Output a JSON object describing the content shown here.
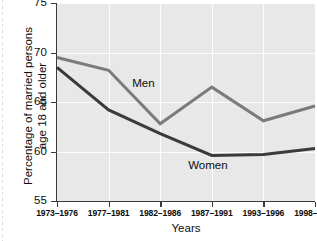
{
  "chart_data": {
    "type": "line",
    "title": "",
    "xlabel": "Years",
    "ylabel": "Percentage of married persons\nage 18 and older",
    "categories": [
      "1973–1976",
      "1977–1981",
      "1982–1986",
      "1987–1991",
      "1993–1996",
      "1998–2002"
    ],
    "ylim": [
      55,
      75
    ],
    "yticks": [
      55,
      60,
      65,
      70,
      75
    ],
    "ytick_labels": [
      "55",
      "60",
      "65",
      "70",
      "75"
    ],
    "grid": true,
    "legend_position": "inline-annotations",
    "series": [
      {
        "name": "Men",
        "color": "#7b7b7b",
        "values": [
          69.5,
          68.2,
          62.8,
          66.5,
          63.1,
          64.6
        ],
        "annotation": {
          "text": "Men",
          "x_frac": 0.335,
          "y_value": 66.9
        }
      },
      {
        "name": "Women",
        "color": "#3a3a3a",
        "values": [
          68.5,
          64.2,
          61.8,
          59.6,
          59.7,
          60.3
        ],
        "annotation": {
          "text": "Women",
          "x_frac": 0.585,
          "y_value": 58.6
        }
      }
    ]
  },
  "style": {
    "plot_background": "#e8e8e8",
    "page_background": "#ffffff",
    "gridline_color": "#fdfdfd",
    "axis_color": "#3a3a3a",
    "text_color": "#0d0d0d"
  }
}
